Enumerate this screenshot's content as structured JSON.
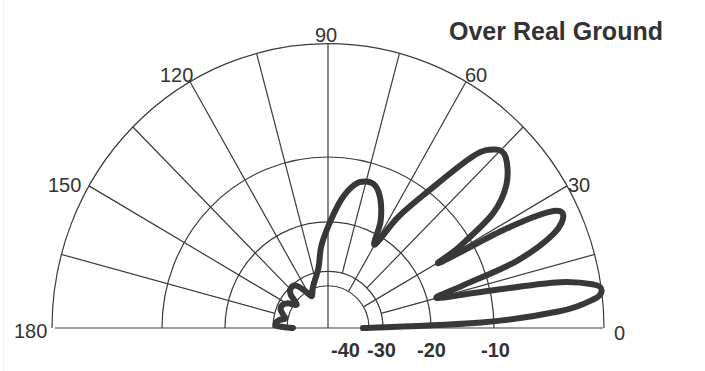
{
  "chart_data": {
    "type": "polar",
    "title": "Over Real Ground",
    "angle_unit": "degrees (elevation)",
    "angle_range": [
      0,
      180
    ],
    "angle_ticks": [
      0,
      30,
      60,
      90,
      120,
      150,
      180
    ],
    "angle_tick_labels": [
      "0",
      "30",
      "60",
      "90",
      "120",
      "150",
      "180"
    ],
    "spoke_step_deg": 15,
    "radial_unit": "dB",
    "radial_scale": "ARRL log",
    "radial_rings": [
      {
        "db": 0,
        "radius_px": 276
      },
      {
        "db": -10,
        "radius_px": 166
      },
      {
        "db": -20,
        "radius_px": 103
      },
      {
        "db": -30,
        "radius_px": 55
      },
      {
        "db": -40,
        "radius_px": 41
      }
    ],
    "radial_tick_labels": [
      "-40",
      "-30",
      "-20",
      "-10"
    ],
    "grid": true,
    "legend": null,
    "series": [
      {
        "name": "Elevation pattern",
        "points": [
          [
            0,
            -45
          ],
          [
            2,
            -12
          ],
          [
            4,
            -4
          ],
          [
            6,
            -0.8
          ],
          [
            7.5,
            0
          ],
          [
            9,
            -0.6
          ],
          [
            11,
            -4
          ],
          [
            13,
            -12
          ],
          [
            15,
            -18.5
          ],
          [
            17,
            -14
          ],
          [
            19,
            -7
          ],
          [
            22,
            -3
          ],
          [
            25,
            -1.5
          ],
          [
            27,
            -2.5
          ],
          [
            28.5,
            -7
          ],
          [
            29.6,
            -16
          ],
          [
            31,
            -12
          ],
          [
            34,
            -7
          ],
          [
            38,
            -4.5
          ],
          [
            43,
            -3
          ],
          [
            46,
            -3.2
          ],
          [
            49,
            -5
          ],
          [
            53,
            -10
          ],
          [
            57,
            -16
          ],
          [
            60,
            -22
          ],
          [
            63,
            -18
          ],
          [
            67,
            -15
          ],
          [
            71,
            -13.2
          ],
          [
            75,
            -13
          ],
          [
            79,
            -13.8
          ],
          [
            84,
            -16.5
          ],
          [
            90,
            -21
          ],
          [
            95,
            -25
          ],
          [
            99,
            -29
          ],
          [
            106,
            -35
          ],
          [
            112,
            -40
          ],
          [
            118,
            -45
          ],
          [
            123,
            -38
          ],
          [
            128,
            -32
          ],
          [
            134,
            -31
          ],
          [
            139,
            -34
          ],
          [
            144,
            -42
          ],
          [
            149,
            -36
          ],
          [
            154,
            -33
          ],
          [
            159,
            -33
          ],
          [
            164,
            -36
          ],
          [
            168,
            -38
          ],
          [
            171,
            -34
          ],
          [
            175,
            -32
          ],
          [
            178,
            -33
          ],
          [
            180,
            -45
          ]
        ]
      }
    ]
  },
  "labels": {
    "title": "Over Real Ground",
    "angles": {
      "a0": "0",
      "a30": "30",
      "a60": "60",
      "a90": "90",
      "a120": "120",
      "a150": "150",
      "a180": "180"
    },
    "db": {
      "m40": "-40",
      "m30": "-30",
      "m20": "-20",
      "m10": "-10"
    }
  }
}
